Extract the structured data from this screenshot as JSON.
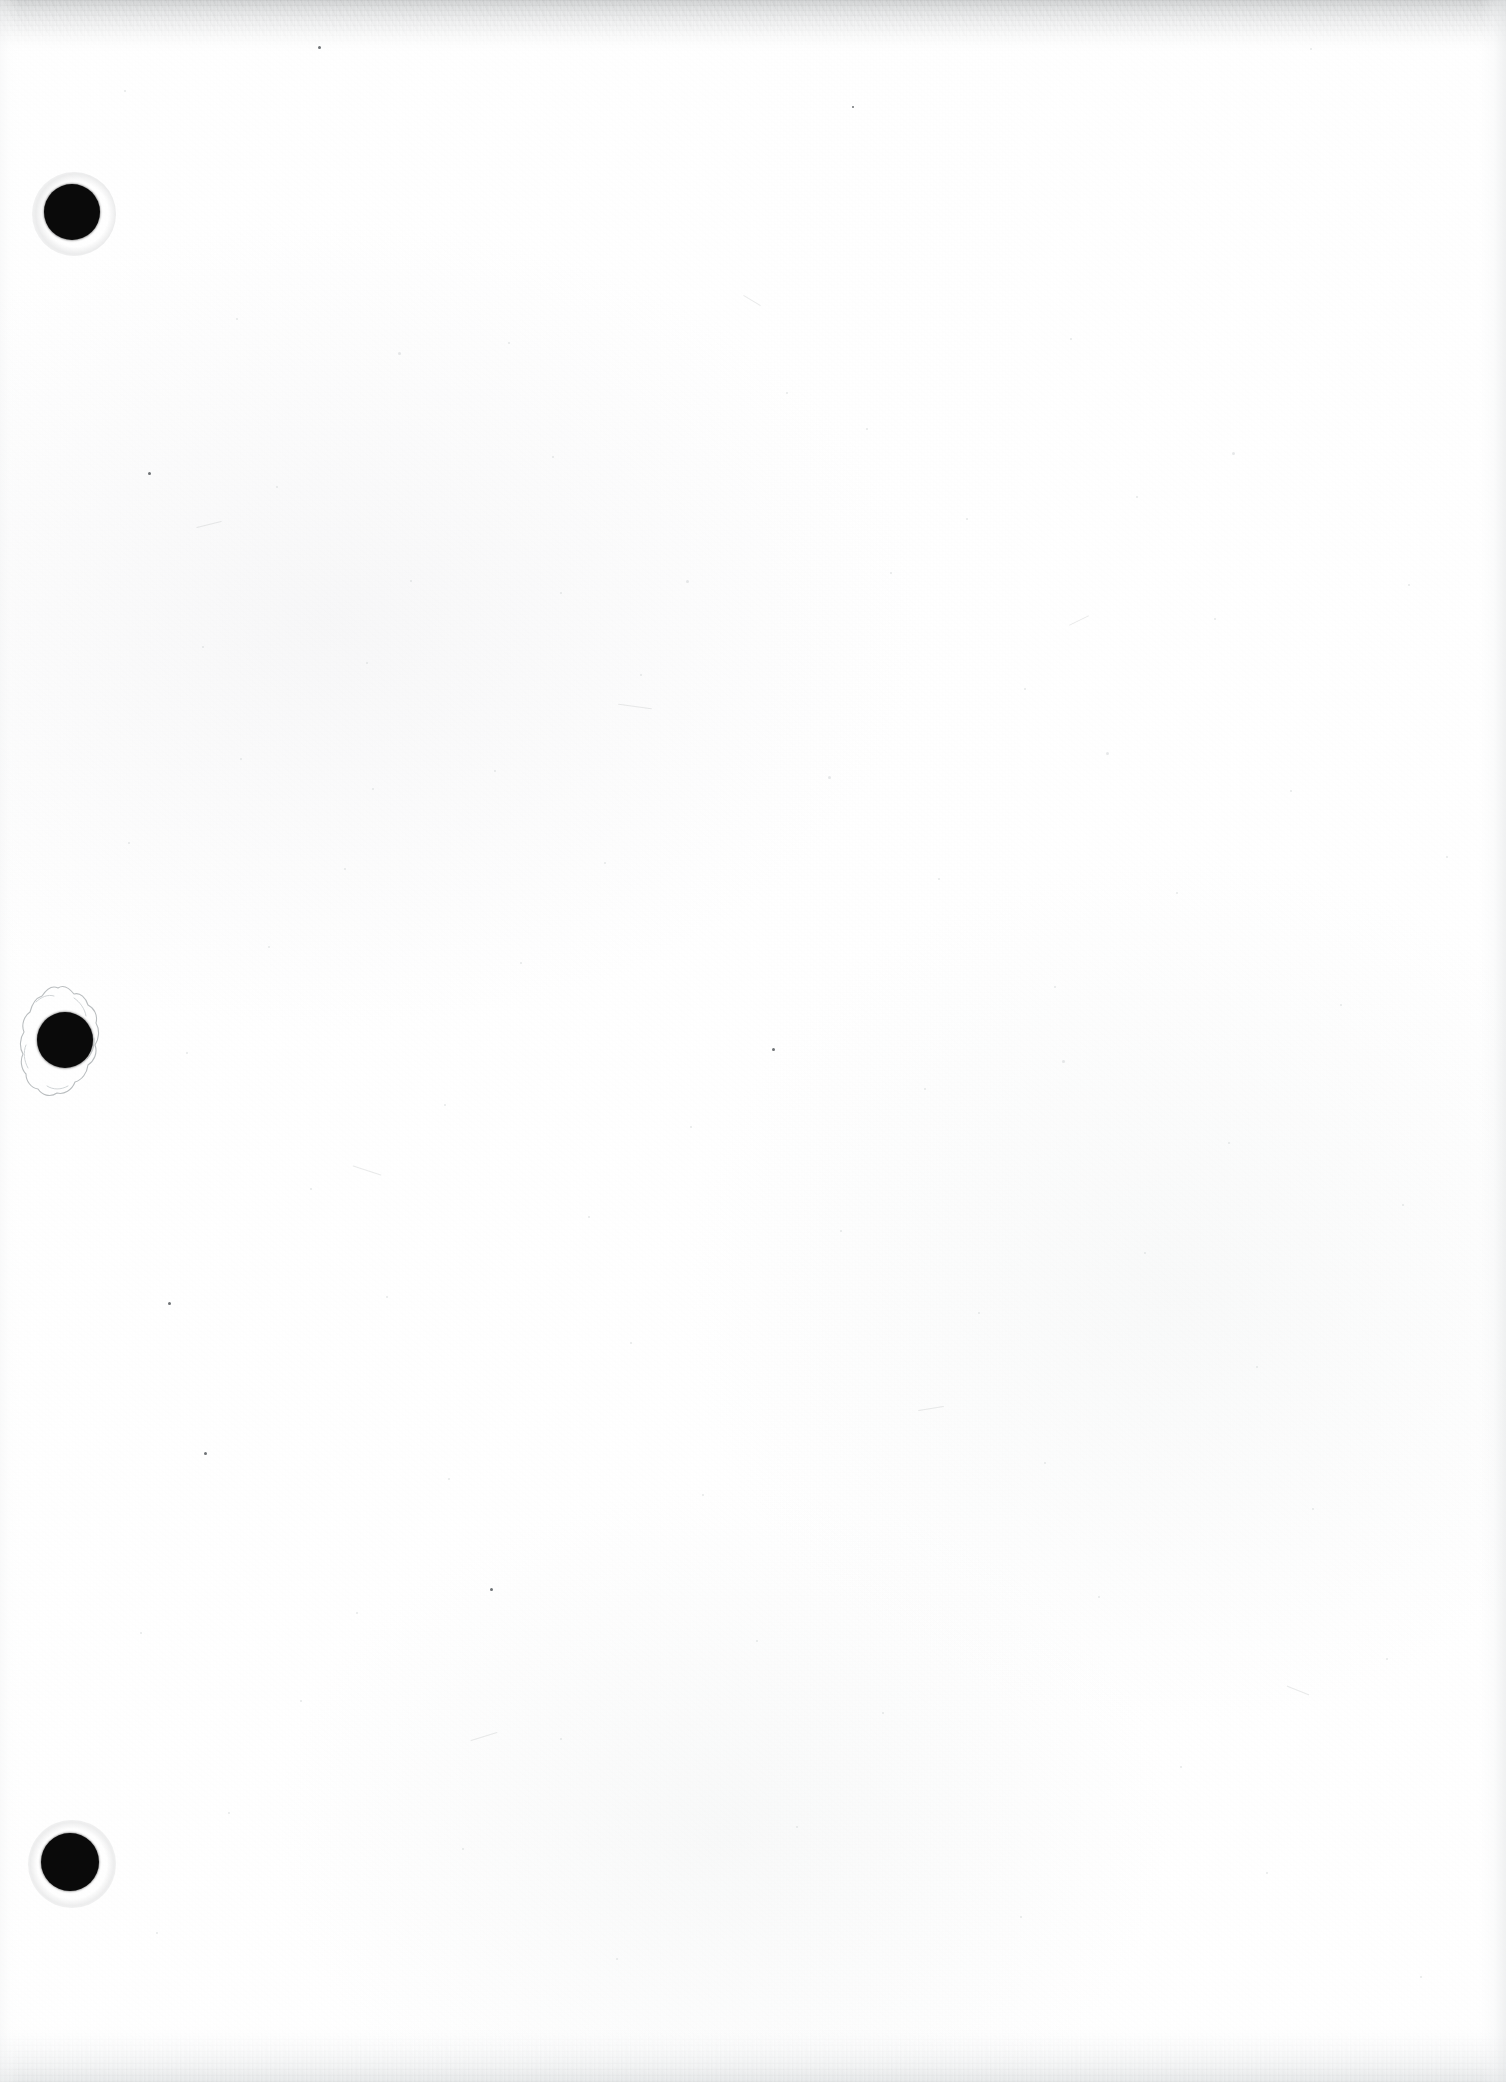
{
  "document": {
    "kind": "scanned-page",
    "page_title": "Scanned blank document page",
    "orientation": "portrait",
    "width_px": 1506,
    "height_px": 2082,
    "body_text": "",
    "has_visible_text": false,
    "description": "Blank white scanned sheet with three black punch holes along the left margin and grey scanner shadow bands at the top and bottom edges."
  },
  "colors": {
    "paper": "#ffffff",
    "hole_fill": "#0a0a0a",
    "top_band": "#cdcfd0",
    "bottom_band": "#e1e4e5",
    "speck": "#9aa0a4",
    "speck_dark": "#4a4f52",
    "tear_outline": "#b9bdbf"
  },
  "holes": [
    {
      "id": "hole-1",
      "label": "Top punch hole",
      "cx": 72,
      "cy": 212,
      "r": 28,
      "torn": false
    },
    {
      "id": "hole-2",
      "label": "Middle punch hole",
      "cx": 65,
      "cy": 1040,
      "r": 28,
      "torn": true
    },
    {
      "id": "hole-3",
      "label": "Bottom punch hole",
      "cx": 70,
      "cy": 1862,
      "r": 29,
      "torn": false
    }
  ],
  "edges": {
    "top_band_height": 52,
    "bottom_band_height": 58,
    "left_band_width": 20,
    "right_band_width": 26
  },
  "specks": [
    {
      "x": 318,
      "y": 46,
      "s": 3,
      "t": "dark"
    },
    {
      "x": 124,
      "y": 90,
      "s": 2,
      "t": "faint"
    },
    {
      "x": 852,
      "y": 106,
      "s": 2,
      "t": "dark"
    },
    {
      "x": 1310,
      "y": 48,
      "s": 2,
      "t": "faint"
    },
    {
      "x": 236,
      "y": 318,
      "s": 2,
      "t": "faint"
    },
    {
      "x": 398,
      "y": 352,
      "s": 3,
      "t": "faint"
    },
    {
      "x": 508,
      "y": 342,
      "s": 2,
      "t": "faint"
    },
    {
      "x": 786,
      "y": 392,
      "s": 2,
      "t": "faint"
    },
    {
      "x": 1070,
      "y": 338,
      "s": 2,
      "t": "faint"
    },
    {
      "x": 1232,
      "y": 452,
      "s": 3,
      "t": "faint"
    },
    {
      "x": 552,
      "y": 456,
      "s": 2,
      "t": "faint"
    },
    {
      "x": 148,
      "y": 472,
      "s": 3,
      "t": "dark"
    },
    {
      "x": 866,
      "y": 428,
      "s": 2,
      "t": "faint"
    },
    {
      "x": 966,
      "y": 518,
      "s": 2,
      "t": "faint"
    },
    {
      "x": 1136,
      "y": 496,
      "s": 2,
      "t": "faint"
    },
    {
      "x": 276,
      "y": 486,
      "s": 2,
      "t": "faint"
    },
    {
      "x": 410,
      "y": 580,
      "s": 2,
      "t": "faint"
    },
    {
      "x": 560,
      "y": 592,
      "s": 2,
      "t": "faint"
    },
    {
      "x": 686,
      "y": 580,
      "s": 3,
      "t": "faint"
    },
    {
      "x": 890,
      "y": 572,
      "s": 2,
      "t": "faint"
    },
    {
      "x": 1214,
      "y": 618,
      "s": 2,
      "t": "faint"
    },
    {
      "x": 1408,
      "y": 584,
      "s": 2,
      "t": "faint"
    },
    {
      "x": 202,
      "y": 646,
      "s": 2,
      "t": "faint"
    },
    {
      "x": 366,
      "y": 662,
      "s": 2,
      "t": "faint"
    },
    {
      "x": 640,
      "y": 674,
      "s": 2,
      "t": "faint"
    },
    {
      "x": 1024,
      "y": 688,
      "s": 2,
      "t": "faint"
    },
    {
      "x": 1106,
      "y": 752,
      "s": 3,
      "t": "faint"
    },
    {
      "x": 240,
      "y": 758,
      "s": 2,
      "t": "faint"
    },
    {
      "x": 372,
      "y": 788,
      "s": 2,
      "t": "faint"
    },
    {
      "x": 494,
      "y": 770,
      "s": 2,
      "t": "faint"
    },
    {
      "x": 828,
      "y": 776,
      "s": 3,
      "t": "faint"
    },
    {
      "x": 1290,
      "y": 790,
      "s": 2,
      "t": "faint"
    },
    {
      "x": 128,
      "y": 842,
      "s": 2,
      "t": "faint"
    },
    {
      "x": 344,
      "y": 868,
      "s": 2,
      "t": "faint"
    },
    {
      "x": 604,
      "y": 862,
      "s": 2,
      "t": "faint"
    },
    {
      "x": 938,
      "y": 878,
      "s": 2,
      "t": "faint"
    },
    {
      "x": 1176,
      "y": 892,
      "s": 2,
      "t": "faint"
    },
    {
      "x": 1446,
      "y": 856,
      "s": 2,
      "t": "faint"
    },
    {
      "x": 268,
      "y": 946,
      "s": 2,
      "t": "faint"
    },
    {
      "x": 520,
      "y": 962,
      "s": 2,
      "t": "faint"
    },
    {
      "x": 772,
      "y": 1048,
      "s": 3,
      "t": "dark"
    },
    {
      "x": 1054,
      "y": 986,
      "s": 2,
      "t": "faint"
    },
    {
      "x": 1340,
      "y": 1004,
      "s": 2,
      "t": "faint"
    },
    {
      "x": 186,
      "y": 1052,
      "s": 2,
      "t": "faint"
    },
    {
      "x": 444,
      "y": 1104,
      "s": 2,
      "t": "faint"
    },
    {
      "x": 690,
      "y": 1126,
      "s": 2,
      "t": "faint"
    },
    {
      "x": 924,
      "y": 1088,
      "s": 2,
      "t": "faint"
    },
    {
      "x": 1228,
      "y": 1142,
      "s": 2,
      "t": "faint"
    },
    {
      "x": 1062,
      "y": 1060,
      "s": 3,
      "t": "faint"
    },
    {
      "x": 310,
      "y": 1188,
      "s": 2,
      "t": "faint"
    },
    {
      "x": 588,
      "y": 1216,
      "s": 2,
      "t": "faint"
    },
    {
      "x": 840,
      "y": 1230,
      "s": 2,
      "t": "faint"
    },
    {
      "x": 1144,
      "y": 1252,
      "s": 2,
      "t": "faint"
    },
    {
      "x": 1402,
      "y": 1204,
      "s": 2,
      "t": "faint"
    },
    {
      "x": 168,
      "y": 1302,
      "s": 3,
      "t": "dark"
    },
    {
      "x": 386,
      "y": 1296,
      "s": 2,
      "t": "faint"
    },
    {
      "x": 630,
      "y": 1342,
      "s": 2,
      "t": "faint"
    },
    {
      "x": 978,
      "y": 1312,
      "s": 2,
      "t": "faint"
    },
    {
      "x": 1256,
      "y": 1366,
      "s": 2,
      "t": "faint"
    },
    {
      "x": 204,
      "y": 1452,
      "s": 3,
      "t": "dark"
    },
    {
      "x": 448,
      "y": 1478,
      "s": 2,
      "t": "faint"
    },
    {
      "x": 702,
      "y": 1494,
      "s": 2,
      "t": "faint"
    },
    {
      "x": 1044,
      "y": 1462,
      "s": 2,
      "t": "faint"
    },
    {
      "x": 1312,
      "y": 1508,
      "s": 2,
      "t": "faint"
    },
    {
      "x": 490,
      "y": 1588,
      "s": 3,
      "t": "dark"
    },
    {
      "x": 140,
      "y": 1632,
      "s": 2,
      "t": "faint"
    },
    {
      "x": 356,
      "y": 1612,
      "s": 2,
      "t": "faint"
    },
    {
      "x": 756,
      "y": 1640,
      "s": 2,
      "t": "faint"
    },
    {
      "x": 1098,
      "y": 1596,
      "s": 2,
      "t": "faint"
    },
    {
      "x": 1386,
      "y": 1658,
      "s": 2,
      "t": "faint"
    },
    {
      "x": 300,
      "y": 1700,
      "s": 2,
      "t": "faint"
    },
    {
      "x": 560,
      "y": 1738,
      "s": 2,
      "t": "faint"
    },
    {
      "x": 882,
      "y": 1712,
      "s": 2,
      "t": "faint"
    },
    {
      "x": 1180,
      "y": 1766,
      "s": 2,
      "t": "faint"
    },
    {
      "x": 228,
      "y": 1812,
      "s": 2,
      "t": "faint"
    },
    {
      "x": 462,
      "y": 1848,
      "s": 2,
      "t": "faint"
    },
    {
      "x": 796,
      "y": 1826,
      "s": 2,
      "t": "faint"
    },
    {
      "x": 1266,
      "y": 1872,
      "s": 2,
      "t": "faint"
    },
    {
      "x": 156,
      "y": 1932,
      "s": 2,
      "t": "faint"
    },
    {
      "x": 616,
      "y": 1958,
      "s": 2,
      "t": "faint"
    },
    {
      "x": 1020,
      "y": 1916,
      "s": 2,
      "t": "faint"
    },
    {
      "x": 1420,
      "y": 1976,
      "s": 2,
      "t": "faint"
    }
  ],
  "fibers": [
    {
      "x": 196,
      "y": 524,
      "w": 26,
      "h": 1,
      "rot": -14
    },
    {
      "x": 618,
      "y": 706,
      "w": 34,
      "h": 1,
      "rot": 8
    },
    {
      "x": 1068,
      "y": 620,
      "w": 22,
      "h": 1,
      "rot": -26
    },
    {
      "x": 352,
      "y": 1170,
      "w": 30,
      "h": 1,
      "rot": 18
    },
    {
      "x": 918,
      "y": 1408,
      "w": 26,
      "h": 1,
      "rot": -9
    },
    {
      "x": 1286,
      "y": 1690,
      "w": 24,
      "h": 1,
      "rot": 22
    },
    {
      "x": 470,
      "y": 1736,
      "w": 28,
      "h": 1,
      "rot": -17
    },
    {
      "x": 742,
      "y": 300,
      "w": 20,
      "h": 1,
      "rot": 31
    }
  ]
}
